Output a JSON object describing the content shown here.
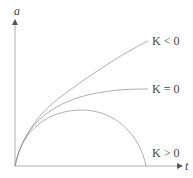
{
  "diagram": {
    "type": "cosmology-scale-factor-plot",
    "axes": {
      "y_label": "a",
      "x_label": "t",
      "color": "#9a9a9a"
    },
    "curves": [
      {
        "id": "open",
        "label": "K < 0",
        "color": "#9a9a9a"
      },
      {
        "id": "flat",
        "label": "K = 0",
        "color": "#9a9a9a"
      },
      {
        "id": "closed",
        "label": "K > 0",
        "color": "#9a9a9a"
      }
    ]
  }
}
